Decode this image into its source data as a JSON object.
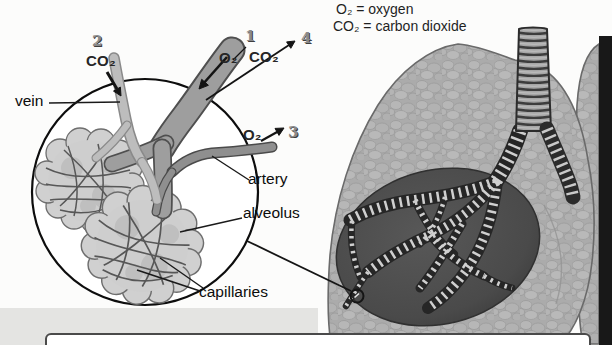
{
  "legend": {
    "oxygen_definition": "O₂ = oxygen",
    "co2_definition": "CO₂ = carbon dioxide"
  },
  "inset": {
    "vein_label": "vein",
    "artery_label": "artery",
    "alveolus_label": "alveolus",
    "capillaries_label": "capillaries",
    "steps": [
      {
        "num": "1",
        "gas": "O₂"
      },
      {
        "num": "2",
        "gas": "CO₂"
      },
      {
        "num": "3",
        "gas": "O₂"
      },
      {
        "num": "4",
        "gas": "CO₂"
      }
    ]
  },
  "colors": {
    "ink": "#111111",
    "number_gray": "#8a8a8a",
    "lung_base": "#ababab",
    "dark_region": "#474747",
    "vein_gray": "#bdbdbd",
    "bronchiole_gray": "#9e9e9e",
    "band_black": "#181818"
  }
}
